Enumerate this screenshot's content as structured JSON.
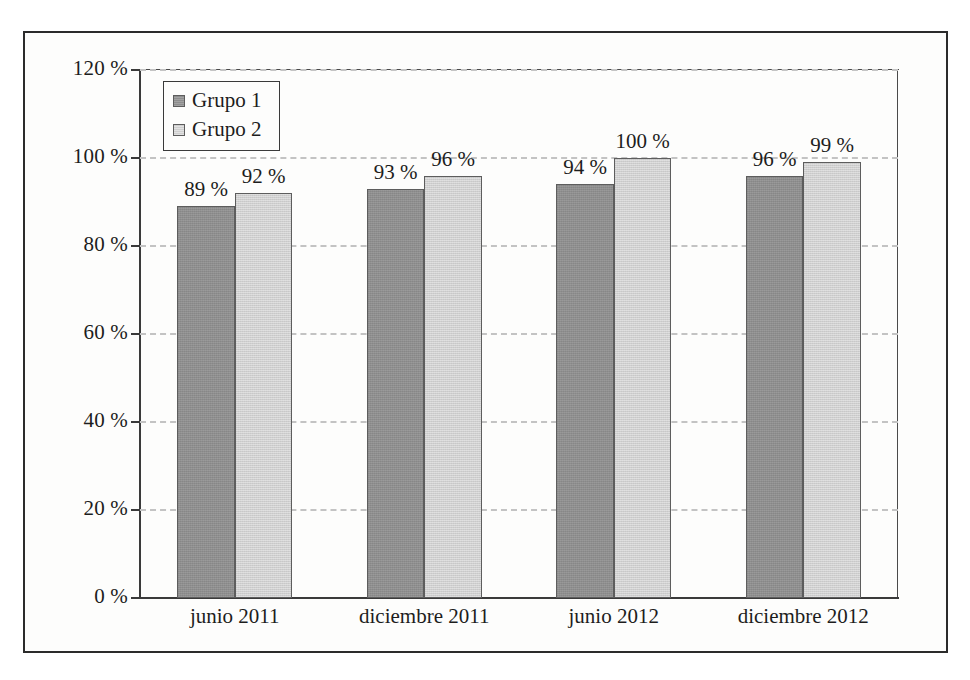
{
  "chart_data": {
    "type": "bar",
    "title": "",
    "subtitle": "",
    "xlabel": "",
    "ylabel": "",
    "categories": [
      "junio 2011",
      "diciembre 2011",
      "junio 2012",
      "diciembre 2012"
    ],
    "series": [
      {
        "name": "Grupo 1",
        "values": [
          89,
          93,
          94,
          96
        ],
        "value_labels": [
          "89 %",
          "93 %",
          "94 %",
          "96 %"
        ],
        "color": "#8e8e8e"
      },
      {
        "name": "Grupo 2",
        "values": [
          92,
          96,
          100,
          99
        ],
        "value_labels": [
          "92 %",
          "96 %",
          "100 %",
          "99 %"
        ],
        "color": "#cfcfcf"
      }
    ],
    "ylim": [
      0,
      120
    ],
    "ytick_values": [
      0,
      20,
      40,
      60,
      80,
      100,
      120
    ],
    "ytick_labels": [
      "0 %",
      "20 %",
      "40 %",
      "60 %",
      "80 %",
      "100 %",
      "120 %"
    ],
    "grid": true,
    "grid_style": "dashed",
    "grid_color": "#c3c3c3",
    "legend": {
      "position": "top-left-inside",
      "entries": [
        "Grupo 1",
        "Grupo 2"
      ]
    },
    "unit": "%",
    "frame_color": "#2b2b2b",
    "axis_color": "#3a3a3a",
    "background": "#fdfdfc"
  }
}
